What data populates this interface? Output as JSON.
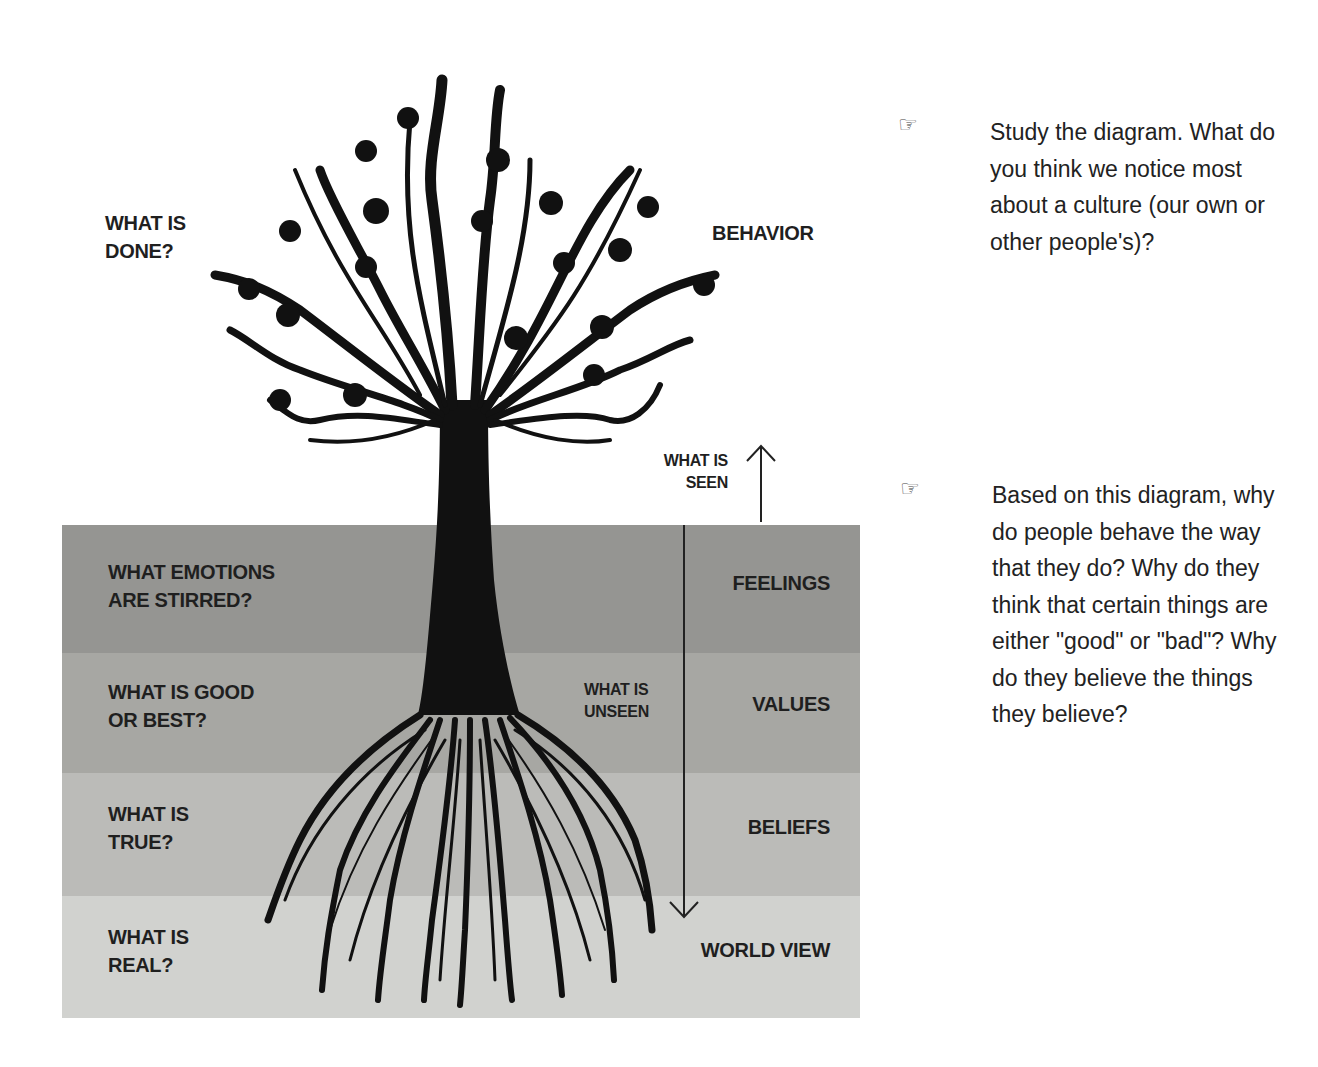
{
  "diagram": {
    "above_ground": {
      "left_question": "WHAT IS\nDONE?",
      "right_label": "BEHAVIOR",
      "seen_label": "WHAT IS\nSEEN"
    },
    "unseen_label": "WHAT IS\nUNSEEN",
    "layers": [
      {
        "question": "WHAT EMOTIONS\nARE STIRRED?",
        "label": "FEELINGS",
        "color": "#959592"
      },
      {
        "question": "WHAT IS GOOD\nOR BEST?",
        "label": "VALUES",
        "color": "#a7a7a3"
      },
      {
        "question": "WHAT IS\nTRUE?",
        "label": "BELIEFS",
        "color": "#bbbbb8"
      },
      {
        "question": "WHAT IS\nREAL?",
        "label": "WORLD VIEW",
        "color": "#d1d2cf"
      }
    ],
    "icons": {
      "tree": "apple-tree-silhouette-icon",
      "roots": "tree-roots-icon",
      "up_arrow": "arrow-up-icon",
      "down_arrow": "arrow-down-icon"
    }
  },
  "questions": [
    {
      "icon": "☞",
      "text": "Study the diagram. What do you think we notice most about a culture (our own or other people's)?"
    },
    {
      "icon": "☞",
      "text": "Based on this diagram, why do people behave the way that they do? Why do they think that certain things are either \"good\" or \"bad\"? Why do they believe the things they believe?"
    }
  ]
}
